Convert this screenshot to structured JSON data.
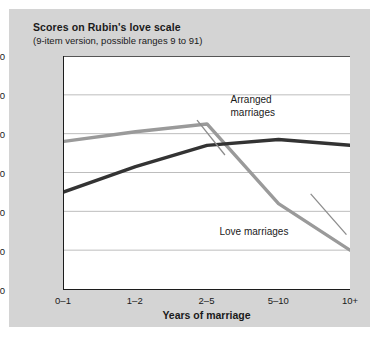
{
  "figure": {
    "title": "Scores on Rubin's love scale",
    "subtitle": "(9-item version, possible ranges 9 to 91)",
    "background_color": "#d4d4d4",
    "plot_background_color": "#ffffff"
  },
  "chart_data": {
    "type": "line",
    "title": "Scores on Rubin's love scale",
    "subtitle": "(9-item version, possible ranges 9 to 91)",
    "xlabel": "Years of marriage",
    "ylabel": "",
    "categories": [
      "0–1",
      "1–2",
      "2–5",
      "5–10",
      "10+"
    ],
    "ylim": [
      30,
      90
    ],
    "yticks": [
      30,
      40,
      50,
      60,
      70,
      80,
      90
    ],
    "grid": true,
    "legend_position": "inline-annotations",
    "series": [
      {
        "name": "Arranged marriages",
        "color": "#9a9a9a",
        "values": [
          68,
          70.5,
          72.5,
          52,
          40
        ]
      },
      {
        "name": "Love marriages",
        "color": "#333333",
        "values": [
          55,
          61.5,
          67,
          68.5,
          67
        ]
      }
    ],
    "annotations": [
      {
        "text_line1": "Arranged",
        "text_line2": "marriages",
        "target_series": "Love marriages"
      },
      {
        "text_line1": "Love marriages",
        "text_line2": "",
        "target_series": "Arranged marriages"
      }
    ]
  }
}
